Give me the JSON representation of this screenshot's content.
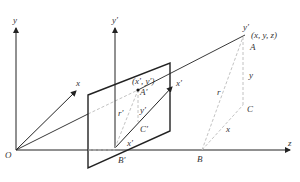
{
  "labels": {
    "y_axis": "y",
    "x_axis": "x",
    "z_axis": "z",
    "origin": "O",
    "y_prime_axis": "y′",
    "x_prime_axis": "x′",
    "point_3d": "(x, y, z)",
    "y_prime_top": "y′",
    "A": "A",
    "y_len": "y",
    "r": "r",
    "C": "C",
    "x_len": "x",
    "B": "B",
    "image_point": "(x′, y′)",
    "A_prime": "A′",
    "y_prime_len": "y′",
    "r_prime": "r′",
    "C_prime": "C′",
    "x_prime_len": "x′",
    "B_prime": "B′"
  }
}
